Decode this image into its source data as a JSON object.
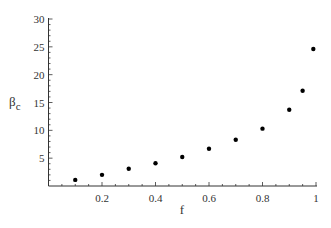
{
  "chart_data": {
    "type": "scatter",
    "title": "",
    "xlabel": "f",
    "ylabel": "β",
    "ylabel_subscript": "c",
    "xlim": [
      0,
      1
    ],
    "ylim": [
      0,
      30
    ],
    "x_ticks": [
      0.2,
      0.4,
      0.6,
      0.8,
      1
    ],
    "x_tick_labels": [
      "0.2",
      "0.4",
      "0.6",
      "0.8",
      "1"
    ],
    "y_ticks": [
      5,
      10,
      15,
      20,
      25,
      30
    ],
    "y_tick_labels": [
      "5",
      "10",
      "15",
      "20",
      "25",
      "30"
    ],
    "grid": false,
    "legend": null,
    "series": [
      {
        "name": "beta_c",
        "color": "#000000",
        "x": [
          0.1,
          0.2,
          0.3,
          0.4,
          0.5,
          0.6,
          0.7,
          0.8,
          0.9,
          0.95,
          0.99
        ],
        "y": [
          1.1,
          2.0,
          3.1,
          4.1,
          5.2,
          6.7,
          8.3,
          10.3,
          13.7,
          17.1,
          24.6
        ]
      }
    ]
  },
  "colors": {
    "axis": "#333333",
    "point": "#000000",
    "background": "#ffffff"
  }
}
